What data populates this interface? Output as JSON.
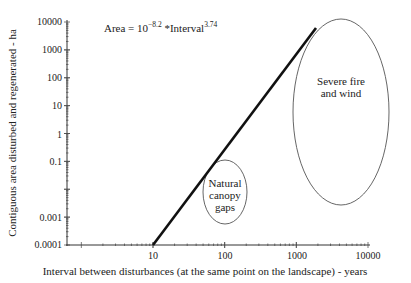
{
  "chart_data": {
    "type": "line",
    "title": "",
    "xlabel": "Interval between disturbances (at the same point on the landscape) - years",
    "ylabel": "Contiguous area disturbed and regenerated - ha",
    "xscale": "log",
    "yscale": "log",
    "xlim": [
      1,
      10000
    ],
    "ylim": [
      0.0001,
      10000
    ],
    "x_ticks": [
      "10",
      "100",
      "1000",
      "10000"
    ],
    "y_ticks": [
      "10000",
      "1000",
      "100",
      "10",
      "1",
      "0.1",
      "0.001",
      "0.0001"
    ],
    "grid": false,
    "legend": null,
    "equation": {
      "prefix": "Area = 10",
      "exponent1": "−8.2",
      "middle": " *Interval",
      "exponent2": "3.74"
    },
    "series": [
      {
        "name": "Area = 10^-8.2 * Interval^3.74",
        "x": [
          12,
          1600
        ],
        "y": [
          0.0001,
          6000
        ]
      }
    ],
    "annotations": [
      {
        "label_lines": [
          "Natural",
          "canopy",
          "gaps"
        ],
        "shape": "ellipse",
        "x_center": 100,
        "y_center": 0.01
      },
      {
        "label_lines": [
          "Severe fire",
          "and wind"
        ],
        "shape": "ellipse",
        "x_center": 3000,
        "y_center": 3
      }
    ]
  }
}
